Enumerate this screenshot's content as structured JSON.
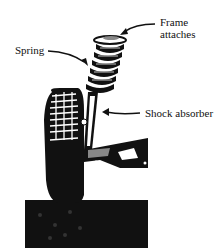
{
  "diagram": {
    "labels": {
      "frame_attaches_line1": "Frame",
      "frame_attaches_line2": "attaches",
      "spring": "Spring",
      "shock_absorber": "Shock absorber"
    },
    "colors": {
      "ink": "#111111",
      "gray": "#888888",
      "background": "#ffffff"
    }
  }
}
